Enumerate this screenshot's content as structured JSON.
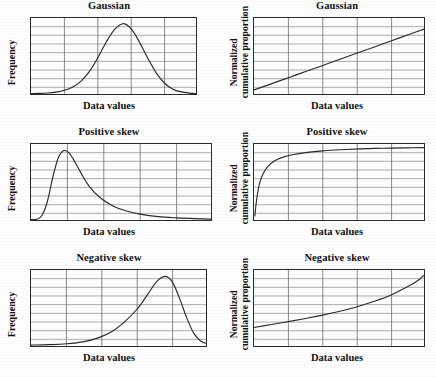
{
  "figure": {
    "background": "#ffffff",
    "line_color": "#2a2a2a",
    "grid_color": "#8a8a8a",
    "layout": "3 rows x 2 columns of plots"
  },
  "labels": {
    "x_axis": "Data values",
    "y_axis_frequency": "Normalized",
    "y_axis_left": "Frequency",
    "y_axis_right_line1": "Normalized",
    "y_axis_right_line2": "cumulative proportion"
  },
  "chart_data": [
    {
      "id": "gaussian-pdf",
      "type": "line",
      "title": "Gaussian",
      "xlabel": "Data values",
      "ylabel": "Frequency",
      "grid": true,
      "grid_rows": 9,
      "grid_cols": 5,
      "xlim": [
        0,
        1
      ],
      "ylim": [
        0,
        1
      ],
      "x": [
        0.0,
        0.05,
        0.1,
        0.15,
        0.2,
        0.25,
        0.3,
        0.35,
        0.4,
        0.45,
        0.5,
        0.55,
        0.6,
        0.65,
        0.7,
        0.75,
        0.8,
        0.85,
        0.9,
        0.95,
        1.0
      ],
      "y": [
        0.005,
        0.008,
        0.014,
        0.026,
        0.05,
        0.095,
        0.175,
        0.305,
        0.49,
        0.7,
        0.87,
        0.95,
        0.88,
        0.7,
        0.48,
        0.285,
        0.145,
        0.065,
        0.028,
        0.012,
        0.006
      ]
    },
    {
      "id": "gaussian-cdf",
      "type": "line",
      "title": "Gaussian",
      "xlabel": "Data values",
      "ylabel": "Normalized cumulative proportion",
      "grid": true,
      "grid_rows": 9,
      "grid_cols": 5,
      "xlim": [
        0,
        1
      ],
      "ylim": [
        0,
        1
      ],
      "x": [
        0.0,
        0.1,
        0.2,
        0.3,
        0.4,
        0.5,
        0.6,
        0.7,
        0.8,
        0.9,
        1.0
      ],
      "y": [
        0.055,
        0.137,
        0.22,
        0.303,
        0.386,
        0.47,
        0.553,
        0.636,
        0.72,
        0.803,
        0.887
      ]
    },
    {
      "id": "positive-skew-pdf",
      "type": "line",
      "title": "Positive skew",
      "xlabel": "Data values",
      "ylabel": "Frequency",
      "grid": true,
      "grid_rows": 9,
      "grid_cols": 5,
      "xlim": [
        0,
        1
      ],
      "ylim": [
        0,
        1
      ],
      "x": [
        0.0,
        0.03,
        0.06,
        0.09,
        0.12,
        0.15,
        0.18,
        0.21,
        0.24,
        0.28,
        0.32,
        0.38,
        0.45,
        0.52,
        0.6,
        0.7,
        0.8,
        0.9,
        1.0
      ],
      "y": [
        0.005,
        0.01,
        0.06,
        0.25,
        0.58,
        0.84,
        0.94,
        0.905,
        0.79,
        0.61,
        0.455,
        0.3,
        0.19,
        0.125,
        0.08,
        0.045,
        0.028,
        0.018,
        0.012
      ]
    },
    {
      "id": "positive-skew-cdf",
      "type": "line",
      "title": "Positive skew",
      "xlabel": "Data values",
      "ylabel": "Normalized cumulative proportion",
      "grid": true,
      "grid_rows": 9,
      "grid_cols": 5,
      "xlim": [
        0,
        1
      ],
      "ylim": [
        0,
        1
      ],
      "x": [
        0.005,
        0.015,
        0.03,
        0.05,
        0.08,
        0.12,
        0.17,
        0.23,
        0.3,
        0.4,
        0.5,
        0.62,
        0.75,
        0.88,
        1.0
      ],
      "y": [
        0.055,
        0.27,
        0.47,
        0.61,
        0.72,
        0.8,
        0.85,
        0.885,
        0.91,
        0.935,
        0.95,
        0.962,
        0.97,
        0.975,
        0.978
      ]
    },
    {
      "id": "negative-skew-pdf",
      "type": "line",
      "title": "Negative skew",
      "xlabel": "Data values",
      "ylabel": "Frequency",
      "grid": true,
      "grid_rows": 9,
      "grid_cols": 5,
      "xlim": [
        0,
        1
      ],
      "ylim": [
        0,
        1
      ],
      "x": [
        0.0,
        0.1,
        0.2,
        0.3,
        0.38,
        0.46,
        0.53,
        0.6,
        0.66,
        0.71,
        0.76,
        0.8,
        0.84,
        0.88,
        0.92,
        0.96,
        1.0
      ],
      "y": [
        0.012,
        0.018,
        0.03,
        0.06,
        0.11,
        0.2,
        0.33,
        0.5,
        0.7,
        0.87,
        0.94,
        0.86,
        0.64,
        0.38,
        0.17,
        0.065,
        0.03
      ]
    },
    {
      "id": "negative-skew-cdf",
      "type": "line",
      "title": "Negative skew",
      "xlabel": "Data values",
      "ylabel": "Normalized cumulative proportion",
      "grid": true,
      "grid_rows": 9,
      "grid_cols": 5,
      "xlim": [
        0,
        1
      ],
      "ylim": [
        0,
        1
      ],
      "x": [
        0.0,
        0.1,
        0.2,
        0.3,
        0.4,
        0.5,
        0.6,
        0.7,
        0.78,
        0.85,
        0.9,
        0.94,
        0.965,
        0.98,
        0.99
      ],
      "y": [
        0.25,
        0.29,
        0.33,
        0.372,
        0.418,
        0.47,
        0.53,
        0.605,
        0.672,
        0.75,
        0.81,
        0.865,
        0.905,
        0.94,
        0.955
      ]
    }
  ],
  "panels": [
    {
      "title": "Gaussian",
      "row": 1,
      "column": "left"
    },
    {
      "title": "Gaussian",
      "row": 1,
      "column": "right"
    },
    {
      "title": "Positive skew",
      "row": 2,
      "column": "left"
    },
    {
      "title": "Positive skew",
      "row": 2,
      "column": "right"
    },
    {
      "title": "Negative skew",
      "row": 3,
      "column": "left"
    },
    {
      "title": "Negative skew",
      "row": 3,
      "column": "right"
    }
  ]
}
